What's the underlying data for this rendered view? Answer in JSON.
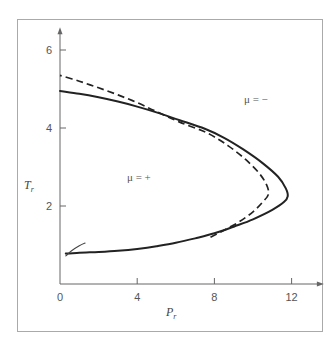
{
  "chart_data": {
    "type": "line",
    "title": "",
    "xlabel": "P",
    "xlabel_sub": "r",
    "ylabel": "T",
    "ylabel_sub": "r",
    "xlim": [
      0,
      13
    ],
    "ylim": [
      0,
      6.3
    ],
    "x_ticks": [
      0,
      4,
      8,
      12
    ],
    "x_tick_labels": [
      "0",
      "4",
      "8",
      "12"
    ],
    "y_ticks": [
      2,
      4,
      6
    ],
    "y_tick_labels": [
      "2",
      "4",
      "6"
    ],
    "grid": false,
    "legend": "none",
    "annotations": [
      {
        "text": "μ = −",
        "x": 9.5,
        "y": 4.7
      },
      {
        "text": "μ = +",
        "x": 4.2,
        "y": 2.8
      }
    ],
    "series": [
      {
        "name": "solid-inversion-curve",
        "style": "solid",
        "points": [
          [
            0.3,
            0.78
          ],
          [
            1,
            0.8
          ],
          [
            2,
            0.82
          ],
          [
            3,
            0.85
          ],
          [
            4,
            0.9
          ],
          [
            5,
            0.97
          ],
          [
            6,
            1.06
          ],
          [
            7,
            1.17
          ],
          [
            8,
            1.3
          ],
          [
            9,
            1.47
          ],
          [
            10,
            1.66
          ],
          [
            11,
            1.9
          ],
          [
            11.6,
            2.1
          ],
          [
            11.8,
            2.25
          ],
          [
            11.7,
            2.45
          ],
          [
            11.3,
            2.75
          ],
          [
            10.5,
            3.1
          ],
          [
            9.5,
            3.45
          ],
          [
            8.5,
            3.75
          ],
          [
            7.5,
            3.98
          ],
          [
            6.2,
            4.2
          ],
          [
            5,
            4.4
          ],
          [
            4,
            4.55
          ],
          [
            3,
            4.68
          ],
          [
            2,
            4.79
          ],
          [
            1,
            4.88
          ],
          [
            0,
            4.95
          ]
        ]
      },
      {
        "name": "dashed-inversion-curve",
        "style": "dashed",
        "points": [
          [
            7.8,
            1.2
          ],
          [
            8.5,
            1.38
          ],
          [
            9.3,
            1.6
          ],
          [
            10,
            1.85
          ],
          [
            10.5,
            2.1
          ],
          [
            10.8,
            2.3
          ],
          [
            10.7,
            2.55
          ],
          [
            10.3,
            2.85
          ],
          [
            9.6,
            3.2
          ],
          [
            8.7,
            3.55
          ],
          [
            7.6,
            3.88
          ],
          [
            6.2,
            4.15
          ],
          [
            5,
            4.42
          ],
          [
            4,
            4.65
          ],
          [
            3,
            4.85
          ],
          [
            2,
            5.03
          ],
          [
            1,
            5.2
          ],
          [
            0,
            5.35
          ]
        ]
      },
      {
        "name": "low-branch-stub",
        "style": "solid-thin",
        "points": [
          [
            0.3,
            0.72
          ],
          [
            0.6,
            0.85
          ],
          [
            1,
            0.98
          ],
          [
            1.3,
            1.05
          ]
        ]
      }
    ]
  }
}
